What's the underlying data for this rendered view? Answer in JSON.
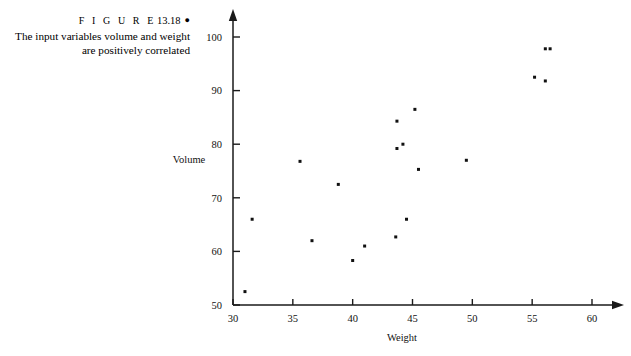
{
  "figure": {
    "label_word": "F I G U R E",
    "number": "13.18",
    "bullet": "●",
    "caption_line_1": "The input variables volume and weight",
    "caption_line_2": "are positively correlated"
  },
  "chart_data": {
    "type": "scatter",
    "title": "",
    "xlabel": "Weight",
    "ylabel": "Volume",
    "xlim": [
      30,
      60
    ],
    "ylim": [
      50,
      100
    ],
    "xticks": [
      30,
      35,
      40,
      45,
      50,
      55,
      60
    ],
    "xtick_labels": [
      "30",
      "35",
      "40",
      "45",
      "50",
      "55",
      "60"
    ],
    "yticks": [
      50,
      60,
      70,
      80,
      90,
      100
    ],
    "ytick_labels": [
      "50",
      "60",
      "70",
      "80",
      "90",
      "100"
    ],
    "grid": false,
    "legend": null,
    "marker": "square",
    "marker_color": "#111111",
    "marker_size_px": 3,
    "points": [
      {
        "x": 31.0,
        "y": 52.5
      },
      {
        "x": 31.6,
        "y": 66.0
      },
      {
        "x": 35.6,
        "y": 76.8
      },
      {
        "x": 36.6,
        "y": 62.0
      },
      {
        "x": 38.8,
        "y": 72.5
      },
      {
        "x": 40.0,
        "y": 58.3
      },
      {
        "x": 41.0,
        "y": 61.0
      },
      {
        "x": 43.6,
        "y": 62.7
      },
      {
        "x": 43.7,
        "y": 79.2
      },
      {
        "x": 43.7,
        "y": 84.3
      },
      {
        "x": 44.2,
        "y": 80.0
      },
      {
        "x": 44.5,
        "y": 66.0
      },
      {
        "x": 45.2,
        "y": 86.5
      },
      {
        "x": 45.5,
        "y": 75.3
      },
      {
        "x": 49.5,
        "y": 77.0
      },
      {
        "x": 55.2,
        "y": 92.5
      },
      {
        "x": 56.1,
        "y": 91.8
      },
      {
        "x": 56.1,
        "y": 97.8
      },
      {
        "x": 56.5,
        "y": 97.8
      }
    ]
  },
  "geometry": {
    "x_axis_y_px": 305,
    "y_axis_x_px": 233,
    "x0_px": 233,
    "x1_px": 592,
    "y_bottom_px": 305,
    "y_top_px": 37
  },
  "colors": {
    "axis": "#1a1a1a",
    "text": "#111111",
    "background": "#ffffff",
    "marker": "#111111"
  }
}
